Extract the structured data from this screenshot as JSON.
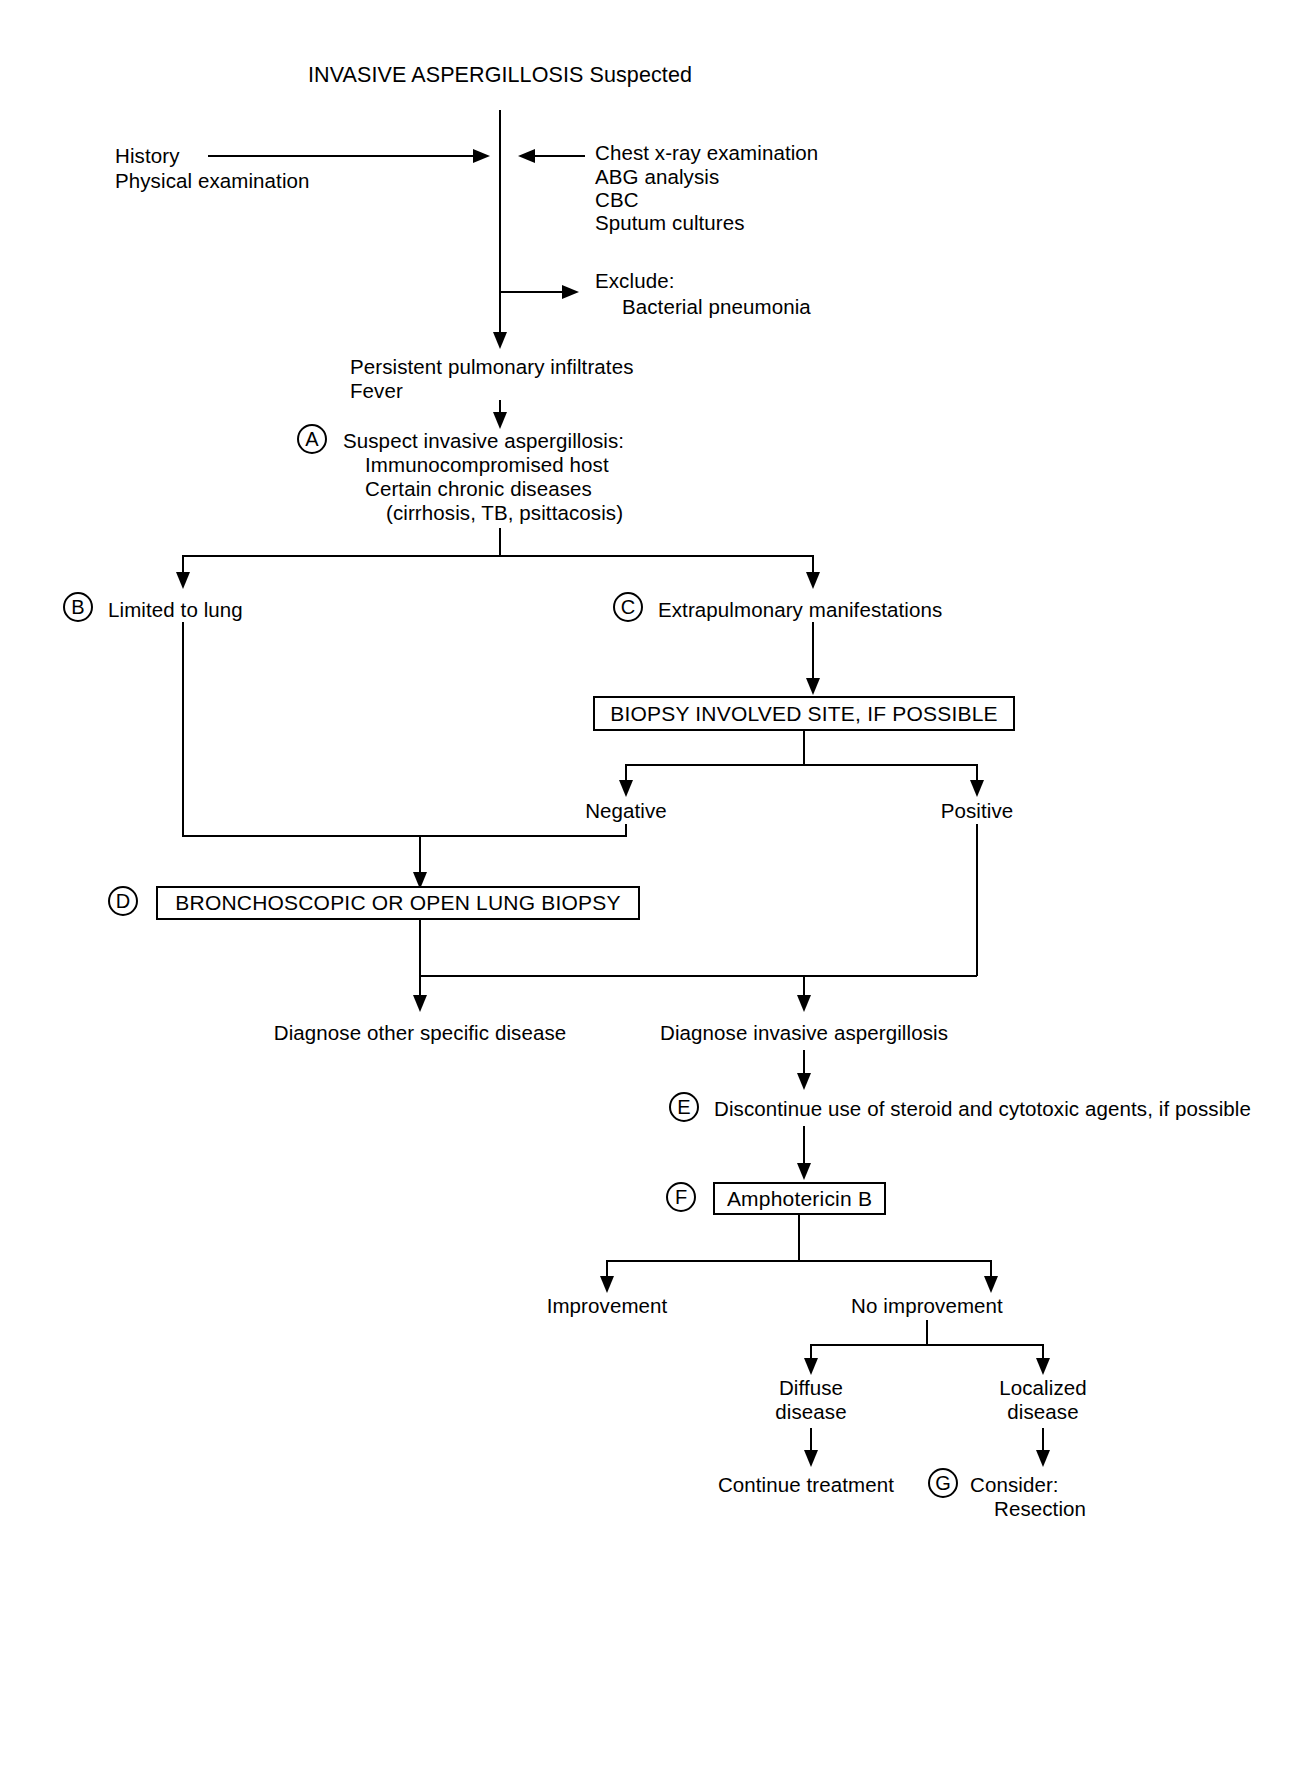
{
  "diagram": {
    "title": "INVASIVE ASPERGILLOSIS Suspected",
    "type": "clinical-decision-flowchart",
    "nodes": {
      "title": "INVASIVE ASPERGILLOSIS Suspected",
      "history_line1": "History",
      "history_line2": "Physical examination",
      "workup_line1": "Chest x-ray examination",
      "workup_line2": "ABG analysis",
      "workup_line3": "CBC",
      "workup_line4": "Sputum cultures",
      "exclude_line1": "Exclude:",
      "exclude_line2": "Bacterial pneumonia",
      "findings_line1": "Persistent pulmonary infiltrates",
      "findings_line2": "Fever",
      "a_marker": "A",
      "a_line1": "Suspect invasive aspergillosis:",
      "a_line2": "Immunocompromised host",
      "a_line3": "Certain chronic diseases",
      "a_line4": "(cirrhosis, TB, psittacosis)",
      "b_marker": "B",
      "b_label": "Limited to lung",
      "c_marker": "C",
      "c_label": "Extrapulmonary manifestations",
      "biopsy_box": "BIOPSY INVOLVED SITE, IF POSSIBLE",
      "negative_label": "Negative",
      "positive_label": "Positive",
      "d_marker": "D",
      "d_box": "BRONCHOSCOPIC OR OPEN LUNG BIOPSY",
      "diagnose_other": "Diagnose other specific disease",
      "diagnose_ia": "Diagnose invasive aspergillosis",
      "e_marker": "E",
      "e_label": "Discontinue use of steroid and cytotoxic agents, if possible",
      "f_marker": "F",
      "f_box": "Amphotericin B",
      "improvement_label": "Improvement",
      "no_improvement_label": "No improvement",
      "diffuse_line1": "Diffuse",
      "diffuse_line2": "disease",
      "localized_line1": "Localized",
      "localized_line2": "disease",
      "continue_treatment": "Continue treatment",
      "g_marker": "G",
      "g_line1": "Consider:",
      "g_line2": "Resection"
    },
    "colors": {
      "ink": "#000000",
      "paper": "#ffffff"
    }
  }
}
